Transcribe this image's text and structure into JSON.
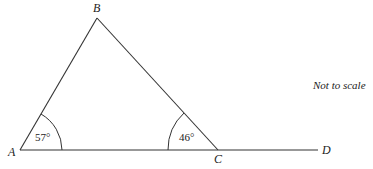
{
  "diagram": {
    "vertices": {
      "A": {
        "label": "A"
      },
      "B": {
        "label": "B"
      },
      "C": {
        "label": "C"
      },
      "D": {
        "label": "D"
      }
    },
    "angles": {
      "A": "57°",
      "C": "46°"
    },
    "note": "Not to scale",
    "colors": {
      "line": "#333333",
      "text": "#222222"
    }
  }
}
